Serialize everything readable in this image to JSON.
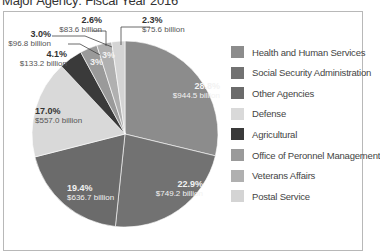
{
  "title": "Major Agency: Fiscal Year 2016",
  "chart_data": {
    "type": "pie",
    "title": "Major Agency: Fiscal Year 2016",
    "legend_position": "right",
    "slices": [
      {
        "name": "Health and Human Services",
        "percent": 28.8,
        "value_label": "$944.5 billion",
        "value_billion": 944.5,
        "color": "#8c8c8c"
      },
      {
        "name": "Social Security Administration",
        "percent": 22.9,
        "value_label": "$749.2 billion",
        "value_billion": 749.2,
        "color": "#727272"
      },
      {
        "name": "Other Agencies",
        "percent": 19.4,
        "value_label": "$636.7 billion",
        "value_billion": 636.7,
        "color": "#6b6b6b"
      },
      {
        "name": "Defense",
        "percent": 17.0,
        "value_label": "$557.0 billion",
        "value_billion": 557.0,
        "color": "#d9d9d9"
      },
      {
        "name": "Agricultural",
        "percent": 4.1,
        "value_label": "$133.2 billion",
        "value_billion": 133.2,
        "color": "#3a3a3a"
      },
      {
        "name": "Office of Peronnel Management",
        "percent": 3.0,
        "value_label": "$96.8 billion",
        "value_billion": 96.8,
        "color": "#9a9a9a"
      },
      {
        "name": "Veterans Affairs",
        "percent": 2.6,
        "value_label": "$83.6 billion",
        "value_billion": 83.6,
        "color": "#b0b0b0"
      },
      {
        "name": "Postal Service",
        "percent": 2.3,
        "value_label": "$75.6 billion",
        "value_billion": 75.6,
        "color": "#d4d4d4"
      }
    ]
  },
  "labels": {
    "hhs": {
      "pct": "28.8%",
      "val": "$944.5 billion"
    },
    "ssa": {
      "pct": "22.9%",
      "val": "$749.2 billion"
    },
    "other": {
      "pct": "19.4%",
      "val": "$636.7 billion"
    },
    "defense": {
      "pct": "17.0%",
      "val": "$557.0 billion"
    },
    "agri": {
      "pct": "4.1%",
      "val": "$133.2 billion"
    },
    "opm": {
      "pct": "3.0%",
      "val": "$96.8 billion"
    },
    "va": {
      "pct": "2.6%",
      "val": "$83.6 billion"
    },
    "postal": {
      "pct": "2.3%",
      "val": "$75.6 billion"
    },
    "opm_inner": "3%",
    "va_inner": "3%"
  }
}
